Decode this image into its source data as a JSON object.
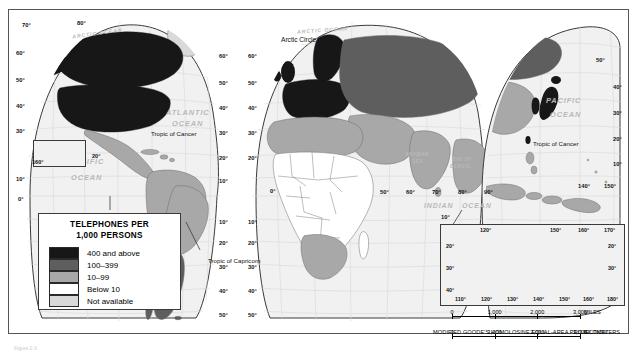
{
  "figure": {
    "caption": "Figure 2-3"
  },
  "legend": {
    "title_line1": "TELEPHONES PER",
    "title_line2": "1,000 PERSONS",
    "classes": [
      {
        "label": "400 and above",
        "color": "#171717"
      },
      {
        "label": "100–399",
        "color": "#5e5e5e"
      },
      {
        "label": "10–99",
        "color": "#a8a8a8"
      },
      {
        "label": "Below 10",
        "color": "#ffffff"
      },
      {
        "label": "Not available",
        "color": "#d9d9d9"
      }
    ]
  },
  "scale": {
    "miles": {
      "unit": "MILES",
      "ticks": [
        "0",
        "1,000",
        "2,000",
        "3,000"
      ]
    },
    "kilometers": {
      "unit": "KILOMETERS",
      "ticks": [
        "0",
        "1,000",
        "2,000",
        "3,000"
      ]
    },
    "projection": "MODIFIED GOODE'S HOMOLOSINE EQUAL-AREA PROJECTION"
  },
  "ocean_labels": [
    {
      "name": "arctic-ocean-west",
      "text": "ARCTIC OCEAN",
      "x": 72,
      "y": 30,
      "size": 5.2,
      "rot": -8
    },
    {
      "name": "arctic-ocean-east",
      "text": "ARCTIC OCEAN",
      "x": 297,
      "y": 27,
      "size": 5.2,
      "rot": -4
    },
    {
      "name": "atlantic-ocean",
      "text": "ATLANTIC",
      "x": 166,
      "y": 108,
      "size": 7.4,
      "rot": 0
    },
    {
      "name": "atlantic-ocean-2",
      "text": "OCEAN",
      "x": 172,
      "y": 119,
      "size": 7.4,
      "rot": 0
    },
    {
      "name": "pacific-ocean-west",
      "text": "PACIFIC",
      "x": 69,
      "y": 157,
      "size": 7.4,
      "rot": 0
    },
    {
      "name": "pacific-ocean-west-2",
      "text": "OCEAN",
      "x": 71,
      "y": 173,
      "size": 7.4,
      "rot": 0
    },
    {
      "name": "pacific-ocean-east",
      "text": "PACIFIC",
      "x": 546,
      "y": 96,
      "size": 7.4,
      "rot": 0
    },
    {
      "name": "pacific-ocean-east-2",
      "text": "OCEAN",
      "x": 550,
      "y": 110,
      "size": 7.4,
      "rot": 0
    },
    {
      "name": "indian-ocean",
      "text": "INDIAN",
      "x": 424,
      "y": 202,
      "size": 7.0,
      "rot": 0
    },
    {
      "name": "indian-ocean-2",
      "text": "OCEAN",
      "x": 462,
      "y": 202,
      "size": 7.0,
      "rot": 0
    }
  ],
  "sea_labels": [
    {
      "name": "arabian-sea",
      "text": "ARABIAN",
      "x": 405,
      "y": 152,
      "size": 4.6
    },
    {
      "name": "arabian-sea-2",
      "text": "SEA",
      "x": 412,
      "y": 159,
      "size": 4.6
    },
    {
      "name": "bay-of-bengal",
      "text": "BAY OF",
      "x": 452,
      "y": 157,
      "size": 4.6
    },
    {
      "name": "bay-of-bengal-2",
      "text": "BENGAL",
      "x": 450,
      "y": 164,
      "size": 4.6
    },
    {
      "name": "coral-sea",
      "text": "CORAL  SEA",
      "x": 555,
      "y": 238,
      "size": 4.4
    }
  ],
  "reference_lines": [
    {
      "name": "arctic-circle",
      "text": "Arctic Circle",
      "x": 281,
      "y": 36,
      "size": 6.6
    },
    {
      "name": "tropic-cancer-west",
      "text": "Tropic of Cancer",
      "x": 151,
      "y": 130,
      "size": 6.2
    },
    {
      "name": "tropic-cancer-east",
      "text": "Tropic of Cancer",
      "x": 533,
      "y": 140,
      "size": 6.2
    },
    {
      "name": "tropic-capricorn",
      "text": "Tropic of Capricorn",
      "x": 208,
      "y": 257,
      "size": 6.2
    }
  ],
  "graticule_labels": {
    "left_lobe_west_edge": [
      {
        "text": "70°",
        "x": 22,
        "y": 22
      },
      {
        "text": "60°",
        "x": 16,
        "y": 50
      },
      {
        "text": "50°",
        "x": 16,
        "y": 77
      },
      {
        "text": "40°",
        "x": 16,
        "y": 103
      },
      {
        "text": "30°",
        "x": 16,
        "y": 128
      },
      {
        "text": "10°",
        "x": 16,
        "y": 176
      },
      {
        "text": "0°",
        "x": 18,
        "y": 196
      }
    ],
    "north_top": [
      {
        "text": "80°",
        "x": 77,
        "y": 20
      }
    ],
    "left_lobe_east_edge": [
      {
        "text": "60°",
        "x": 219,
        "y": 53
      },
      {
        "text": "50°",
        "x": 219,
        "y": 80
      },
      {
        "text": "40°",
        "x": 219,
        "y": 105
      },
      {
        "text": "30°",
        "x": 219,
        "y": 130
      },
      {
        "text": "20°",
        "x": 219,
        "y": 155
      },
      {
        "text": "10°",
        "x": 219,
        "y": 178
      },
      {
        "text": "10°",
        "x": 219,
        "y": 219
      },
      {
        "text": "20°",
        "x": 219,
        "y": 240
      },
      {
        "text": "30°",
        "x": 219,
        "y": 264
      },
      {
        "text": "40°",
        "x": 219,
        "y": 288
      },
      {
        "text": "50°",
        "x": 219,
        "y": 312
      }
    ],
    "center_lobe_west_edge": [
      {
        "text": "60°",
        "x": 248,
        "y": 53
      },
      {
        "text": "50°",
        "x": 248,
        "y": 80
      },
      {
        "text": "40°",
        "x": 248,
        "y": 105
      },
      {
        "text": "30°",
        "x": 248,
        "y": 130
      },
      {
        "text": "20°",
        "x": 248,
        "y": 155
      },
      {
        "text": "10°",
        "x": 248,
        "y": 219
      },
      {
        "text": "20°",
        "x": 248,
        "y": 240
      },
      {
        "text": "30°",
        "x": 248,
        "y": 264
      },
      {
        "text": "40°",
        "x": 248,
        "y": 288
      },
      {
        "text": "50°",
        "x": 248,
        "y": 312
      }
    ],
    "equator_longitudes": [
      {
        "text": "0°",
        "x": 270,
        "y": 188
      },
      {
        "text": "50°",
        "x": 380,
        "y": 189
      },
      {
        "text": "60°",
        "x": 406,
        "y": 189
      },
      {
        "text": "70°",
        "x": 432,
        "y": 189
      },
      {
        "text": "80°",
        "x": 458,
        "y": 189
      },
      {
        "text": "90°",
        "x": 484,
        "y": 189
      },
      {
        "text": "140°",
        "x": 578,
        "y": 183
      },
      {
        "text": "150°",
        "x": 604,
        "y": 183
      }
    ],
    "indian_south": [
      {
        "text": "10°",
        "x": 441,
        "y": 214
      }
    ],
    "right_edge": [
      {
        "text": "50°",
        "x": 596,
        "y": 57
      },
      {
        "text": "40°",
        "x": 613,
        "y": 84
      },
      {
        "text": "30°",
        "x": 613,
        "y": 110
      },
      {
        "text": "20°",
        "x": 613,
        "y": 136
      },
      {
        "text": "10°",
        "x": 613,
        "y": 161
      }
    ]
  },
  "hawaii_inset": {
    "label": "160°",
    "side_label": "20°"
  },
  "australia_inset": {
    "top_longitudes": [
      "120°",
      "150°",
      "160°",
      "170°"
    ],
    "bottom_longitudes": [
      "110°",
      "120°",
      "130°",
      "140°",
      "150°",
      "160°",
      "180°"
    ],
    "left_latitudes": [
      "20°",
      "30°",
      "40°"
    ],
    "right_latitudes": [
      "20°",
      "30°"
    ]
  },
  "colors": {
    "class_high": "#171717",
    "class_mid": "#5e5e5e",
    "class_low": "#a8a8a8",
    "class_below10": "#ffffff",
    "class_na": "#d9d9d9",
    "ocean": "#f1f1f1",
    "border": "#6d6d6d",
    "graticule": "#d0d0d0"
  }
}
